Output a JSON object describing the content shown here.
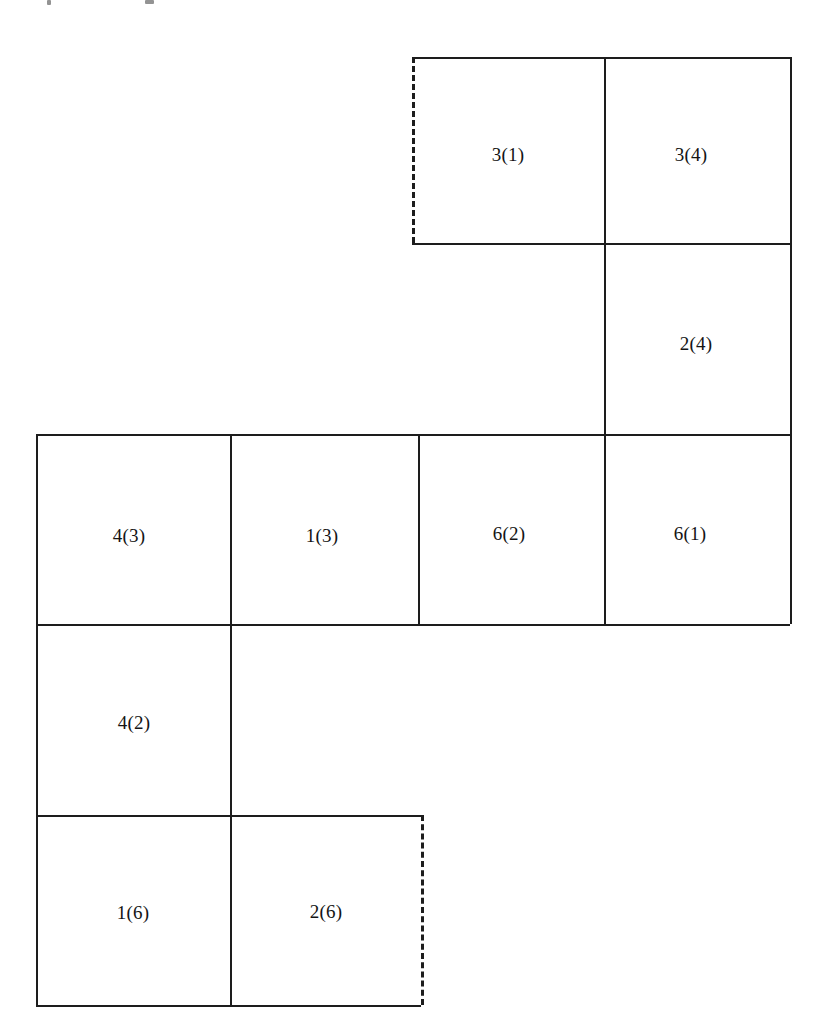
{
  "figure": {
    "title": "",
    "background_color": "#ffffff",
    "line_color": "#1d1d1d",
    "text_color": "#141414",
    "canvas": {
      "width": 835,
      "height": 1025
    }
  },
  "top_marks": [
    {
      "name": "partial-glyph-left",
      "x": 47,
      "y": 0,
      "w": 4,
      "h": 5
    },
    {
      "name": "partial-glyph-right",
      "x": 145,
      "y": 0,
      "w": 9,
      "h": 4
    }
  ],
  "grid": {
    "x_positions": [
      36,
      230,
      418,
      421,
      604,
      790,
      412
    ],
    "y_positions": [
      57,
      243,
      434,
      624,
      815,
      1005
    ]
  },
  "cells": [
    {
      "id": "cell-3-1",
      "label": "3(1)",
      "x": 412,
      "y": 57,
      "w": 192,
      "h": 186,
      "label_cx": 508,
      "label_cy": 154,
      "dashed_edges": [
        "left"
      ]
    },
    {
      "id": "cell-3-4",
      "label": "3(4)",
      "x": 604,
      "y": 57,
      "w": 186,
      "h": 186,
      "label_cx": 691,
      "label_cy": 154,
      "dashed_edges": []
    },
    {
      "id": "cell-2-4",
      "label": "2(4)",
      "x": 604,
      "y": 243,
      "w": 186,
      "h": 191,
      "label_cx": 696,
      "label_cy": 343,
      "dashed_edges": []
    },
    {
      "id": "cell-4-3",
      "label": "4(3)",
      "x": 36,
      "y": 434,
      "w": 194,
      "h": 190,
      "label_cx": 129,
      "label_cy": 535,
      "dashed_edges": []
    },
    {
      "id": "cell-1-3",
      "label": "1(3)",
      "x": 230,
      "y": 434,
      "w": 188,
      "h": 190,
      "label_cx": 322,
      "label_cy": 535,
      "dashed_edges": []
    },
    {
      "id": "cell-6-2",
      "label": "6(2)",
      "x": 418,
      "y": 434,
      "w": 186,
      "h": 190,
      "label_cx": 509,
      "label_cy": 533,
      "dashed_edges": []
    },
    {
      "id": "cell-6-1",
      "label": "6(1)",
      "x": 604,
      "y": 434,
      "w": 186,
      "h": 190,
      "label_cx": 690,
      "label_cy": 533,
      "dashed_edges": []
    },
    {
      "id": "cell-4-2",
      "label": "4(2)",
      "x": 36,
      "y": 624,
      "w": 194,
      "h": 191,
      "label_cx": 134,
      "label_cy": 722,
      "dashed_edges": []
    },
    {
      "id": "cell-1-6",
      "label": "1(6)",
      "x": 36,
      "y": 815,
      "w": 194,
      "h": 190,
      "label_cx": 133,
      "label_cy": 912,
      "dashed_edges": []
    },
    {
      "id": "cell-2-6",
      "label": "2(6)",
      "x": 230,
      "y": 815,
      "w": 191,
      "h": 190,
      "label_cx": 326,
      "label_cy": 911,
      "dashed_edges": [
        "right"
      ]
    }
  ],
  "solid_horizontal_lines": [
    {
      "name": "h-top-upper-block",
      "x": 412,
      "y": 57,
      "w": 378
    },
    {
      "name": "h-under-upper-block",
      "x": 412,
      "y": 243,
      "w": 378
    },
    {
      "name": "h-top-middle-row",
      "x": 36,
      "y": 434,
      "w": 754
    },
    {
      "name": "h-under-middle-row",
      "x": 36,
      "y": 624,
      "w": 754
    },
    {
      "name": "h-above-bottom-row",
      "x": 36,
      "y": 815,
      "w": 385
    },
    {
      "name": "h-bottom-edge",
      "x": 36,
      "y": 1005,
      "w": 385
    }
  ],
  "solid_vertical_lines": [
    {
      "name": "v-left-edge-lower",
      "x": 36,
      "y": 434,
      "h": 571
    },
    {
      "name": "v-col1-divider",
      "x": 230,
      "y": 434,
      "h": 571
    },
    {
      "name": "v-col2-divider-middle",
      "x": 418,
      "y": 434,
      "h": 190
    },
    {
      "name": "v-col3-divider-upper",
      "x": 604,
      "y": 57,
      "h": 567
    },
    {
      "name": "v-right-edge",
      "x": 790,
      "y": 57,
      "h": 567
    }
  ],
  "dashed_vertical_lines": [
    {
      "name": "v-dashed-left-of-3-1",
      "x": 412,
      "y": 57,
      "h": 186
    },
    {
      "name": "v-dashed-right-of-2-6",
      "x": 421,
      "y": 815,
      "h": 190
    }
  ],
  "chart_data": {
    "type": "diagram",
    "title": "",
    "labels": [
      "3(1)",
      "3(4)",
      "2(4)",
      "4(3)",
      "1(3)",
      "6(2)",
      "6(1)",
      "4(2)",
      "1(6)",
      "2(6)"
    ],
    "rows": [
      {
        "row": 1,
        "y_range": [
          57,
          243
        ],
        "cells": [
          "3(1)",
          "3(4)"
        ]
      },
      {
        "row": 2,
        "y_range": [
          243,
          434
        ],
        "cells": [
          "2(4)"
        ]
      },
      {
        "row": 3,
        "y_range": [
          434,
          624
        ],
        "cells": [
          "4(3)",
          "1(3)",
          "6(2)",
          "6(1)"
        ]
      },
      {
        "row": 4,
        "y_range": [
          624,
          815
        ],
        "cells": [
          "4(2)"
        ]
      },
      {
        "row": 5,
        "y_range": [
          815,
          1005
        ],
        "cells": [
          "1(6)",
          "2(6)"
        ]
      }
    ],
    "dashed_boundaries": [
      {
        "cell": "3(1)",
        "edge": "left"
      },
      {
        "cell": "2(6)",
        "edge": "right"
      }
    ],
    "grid_on": false,
    "legend": null
  }
}
